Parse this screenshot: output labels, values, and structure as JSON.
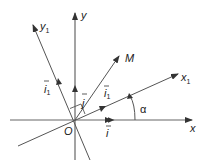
{
  "diagram": {
    "labels": {
      "x": "x",
      "y": "y",
      "x1": "x",
      "x1_sub": "1",
      "y1": "y",
      "y1_sub": "1",
      "M": "M",
      "O": "O",
      "i": "i",
      "j": "j",
      "i1": "i",
      "i1_sub": "1",
      "j1": "i",
      "j1_sub": "1",
      "alpha": "α"
    },
    "colors": {
      "line": "#555555",
      "text": "#222222"
    }
  }
}
